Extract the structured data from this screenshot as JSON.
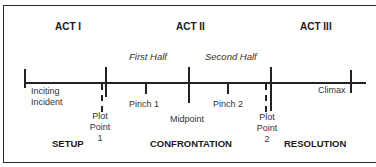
{
  "acts": [
    {
      "label": "ACT I"
    },
    {
      "label": "ACT II"
    },
    {
      "label": "ACT III"
    }
  ],
  "halves": [
    {
      "label": "First Half"
    },
    {
      "label": "Second Half"
    }
  ],
  "points": {
    "inciting_incident": {
      "line1": "Inciting",
      "line2": "Incident"
    },
    "plot_point_1": {
      "line1": "Plot",
      "line2": "Point",
      "line3": "1"
    },
    "pinch_1": {
      "label": "Pinch 1"
    },
    "midpoint": {
      "label": "Midpoint"
    },
    "pinch_2": {
      "label": "Pinch 2"
    },
    "plot_point_2": {
      "line1": "Plot",
      "line2": "Point",
      "line3": "2"
    },
    "climax": {
      "label": "Climax"
    }
  },
  "phases": [
    {
      "label": "SETUP"
    },
    {
      "label": "CONFRONTATION"
    },
    {
      "label": "RESOLUTION"
    }
  ]
}
